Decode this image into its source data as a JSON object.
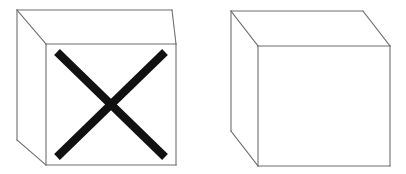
{
  "figure": {
    "background_color": "#ffffff",
    "width": 406,
    "height": 174,
    "edge_color": "#6f6f6f",
    "mark_color": "#111111",
    "face_color": "#ffffff"
  },
  "objects": [
    {
      "id": "left-cube",
      "label": "Cube with X mark on front face",
      "shape": "cube",
      "marked": true,
      "mark": {
        "type": "x-cross",
        "label": "X mark",
        "color": "#111111",
        "stroke_width": 8,
        "diagonal_1": {
          "x1": 57,
          "y1": 52,
          "x2": 165,
          "y2": 157
        },
        "diagonal_2": {
          "x1": 165,
          "y1": 52,
          "x2": 57,
          "y2": 157
        }
      },
      "geometry": {
        "front_face": {
          "x1": 46,
          "y1": 44,
          "x2": 176,
          "y2": 165
        },
        "back_top_left": {
          "x": 17,
          "y": 10
        },
        "back_top_right": {
          "x": 172,
          "y": 10
        },
        "back_bottom_left": {
          "x": 17,
          "y": 140
        },
        "front_top_left": {
          "x": 46,
          "y": 44
        },
        "front_top_right": {
          "x": 176,
          "y": 44
        },
        "front_bottom_left": {
          "x": 46,
          "y": 165
        },
        "front_bottom_right": {
          "x": 176,
          "y": 165
        }
      }
    },
    {
      "id": "right-cube",
      "label": "Plain cube without mark",
      "shape": "cube",
      "marked": false,
      "mark": null,
      "geometry": {
        "front_face": {
          "x1": 258,
          "y1": 46,
          "x2": 390,
          "y2": 166
        },
        "back_top_left": {
          "x": 231,
          "y": 11
        },
        "back_top_right": {
          "x": 363,
          "y": 11
        },
        "back_bottom_left": {
          "x": 231,
          "y": 131
        },
        "front_top_left": {
          "x": 258,
          "y": 46
        },
        "front_top_right": {
          "x": 390,
          "y": 46
        },
        "front_bottom_left": {
          "x": 258,
          "y": 166
        },
        "front_bottom_right": {
          "x": 390,
          "y": 166
        }
      }
    }
  ]
}
